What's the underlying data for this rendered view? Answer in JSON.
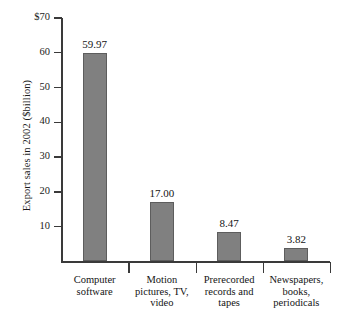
{
  "chart_data": {
    "type": "bar",
    "title": "",
    "xlabel": "",
    "ylabel": "Export sales in 2002 ($billion)",
    "categories": [
      "Computer software",
      "Motion pictures, TV, video",
      "Prerecorded records and tapes",
      "Newspapers, books, periodicals"
    ],
    "category_lines": [
      [
        "Computer",
        "software"
      ],
      [
        "Motion",
        "pictures, TV,",
        "video"
      ],
      [
        "Prerecorded",
        "records and",
        "tapes"
      ],
      [
        "Newspapers,",
        "books,",
        "periodicals"
      ]
    ],
    "values": [
      59.97,
      17.0,
      8.47,
      3.82
    ],
    "value_labels": [
      "59.97",
      "17.00",
      "8.47",
      "3.82"
    ],
    "ylim": [
      0,
      70
    ],
    "yticks": [
      10,
      20,
      30,
      40,
      50,
      60,
      70
    ],
    "ytick_labels": [
      "10",
      "20",
      "30",
      "40",
      "50",
      "60",
      "$70"
    ],
    "grid": false,
    "legend": false,
    "bar_color": "#808080",
    "axis_color": "#3a3a3a",
    "text_color": "#141414"
  }
}
